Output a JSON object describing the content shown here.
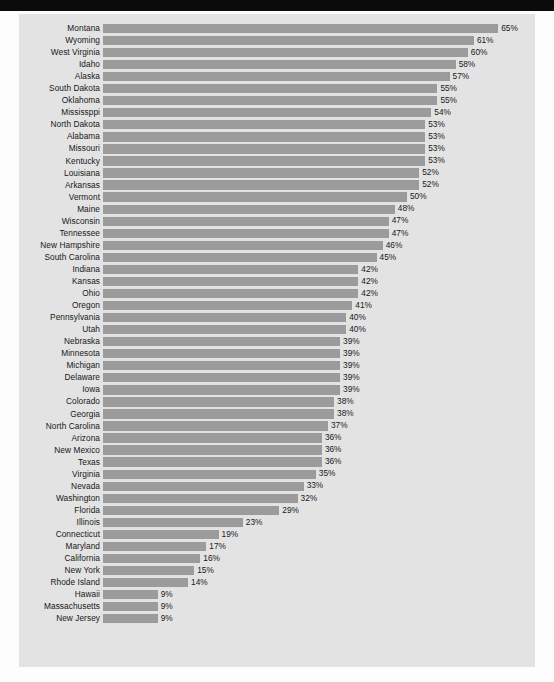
{
  "page": {
    "background_color": "#fdfdfd",
    "panel_color": "#e3e3e3",
    "header_strip_color": "#0b0b0b"
  },
  "chart_data": {
    "type": "bar",
    "orientation": "horizontal",
    "title": "",
    "subtitle": "",
    "xlabel": "",
    "ylabel": "",
    "xlim": [
      0,
      70
    ],
    "grid": false,
    "legend": null,
    "bar_color": "#9b9b9b",
    "value_suffix": "%",
    "categories": [
      "Montana",
      "Wyoming",
      "West Virginia",
      "Idaho",
      "Alaska",
      "South Dakota",
      "Oklahoma",
      "Mississppi",
      "North Dakota",
      "Alabama",
      "Missouri",
      "Kentucky",
      "Louisiana",
      "Arkansas",
      "Vermont",
      "Maine",
      "Wisconsin",
      "Tennessee",
      "New Hampshire",
      "South Carolina",
      "Indiana",
      "Kansas",
      "Ohio",
      "Oregon",
      "Pennsylvania",
      "Utah",
      "Nebraska",
      "Minnesota",
      "Michigan",
      "Delaware",
      "Iowa",
      "Colorado",
      "Georgia",
      "North Carolina",
      "Arizona",
      "New Mexico",
      "Texas",
      "Virginia",
      "Nevada",
      "Washington",
      "Florida",
      "Illinois",
      "Connecticut",
      "Maryland",
      "California",
      "New York",
      "Rhode Island",
      "Hawaii",
      "Massachusetts",
      "New Jersey"
    ],
    "values": [
      65,
      61,
      60,
      58,
      57,
      55,
      55,
      54,
      53,
      53,
      53,
      53,
      52,
      52,
      50,
      48,
      47,
      47,
      46,
      45,
      42,
      42,
      42,
      41,
      40,
      40,
      39,
      39,
      39,
      39,
      39,
      38,
      38,
      37,
      36,
      36,
      36,
      35,
      33,
      32,
      29,
      23,
      19,
      17,
      16,
      15,
      14,
      9,
      9,
      9
    ],
    "value_labels": [
      "65%",
      "61%",
      "60%",
      "58%",
      "57%",
      "55%",
      "55%",
      "54%",
      "53%",
      "53%",
      "53%",
      "53%",
      "52%",
      "52%",
      "50%",
      "48%",
      "47%",
      "47%",
      "46%",
      "45%",
      "42%",
      "42%",
      "42%",
      "41%",
      "40%",
      "40%",
      "39%",
      "39%",
      "39%",
      "39%",
      "39%",
      "38%",
      "38%",
      "37%",
      "36%",
      "36%",
      "36%",
      "35%",
      "33%",
      "32%",
      "29%",
      "23%",
      "19%",
      "17%",
      "16%",
      "15%",
      "14%",
      "9%",
      "9%",
      "9%"
    ]
  }
}
